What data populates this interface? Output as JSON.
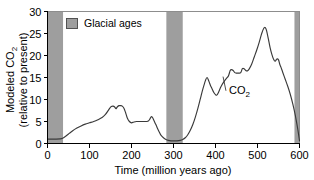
{
  "figure": {
    "background_color": "#ffffff",
    "curve_color": "#3a3a3a",
    "band_color": "#9e9e9e",
    "axis_color": "#000000"
  },
  "axes": {
    "x": {
      "title_main": "Time (million years ago)",
      "ticks": [
        0,
        100,
        200,
        300,
        400,
        500,
        600
      ],
      "tick_labels": [
        "0",
        "100",
        "200",
        "300",
        "400",
        "500",
        "600"
      ],
      "min": 0,
      "max": 600
    },
    "y": {
      "title_line1_main": "Modeled CO",
      "title_line1_sub": "2",
      "title_line2": "(relative to present)",
      "ticks": [
        0,
        5,
        10,
        15,
        20,
        25,
        30
      ],
      "tick_labels": [
        "0",
        "5",
        "10",
        "15",
        "20",
        "25",
        "30"
      ],
      "min": 0,
      "max": 30
    }
  },
  "legend": {
    "label": "Glacial ages",
    "swatch_color": "#9e9e9e"
  },
  "annotations": [
    {
      "name": "co2-curve-label",
      "text_main": "CO",
      "text_sub": "2",
      "x_data": 432,
      "y_data": 11.3,
      "leader_from_x": 418,
      "leader_from_y": 15.2
    }
  ],
  "chart_data": {
    "type": "line",
    "title": "",
    "xlabel": "Time (million years ago)",
    "ylabel": "Modeled CO2 (relative to present)",
    "xlim": [
      0,
      600
    ],
    "ylim": [
      0,
      30
    ],
    "grid": false,
    "legend_position": "top-left-inside",
    "series": [
      {
        "name": "CO2",
        "color": "#3a3a3a",
        "x": [
          0,
          10,
          20,
          30,
          36,
          44,
          52,
          60,
          70,
          80,
          90,
          100,
          110,
          120,
          130,
          138,
          144,
          148,
          152,
          156,
          160,
          163,
          166,
          170,
          174,
          178,
          182,
          186,
          190,
          195,
          200,
          206,
          212,
          220,
          228,
          236,
          240,
          244,
          247,
          250,
          254,
          258,
          262,
          266,
          270,
          276,
          282,
          288,
          294,
          300,
          308,
          316,
          322,
          328,
          334,
          340,
          346,
          352,
          358,
          364,
          370,
          376,
          380,
          384,
          388,
          392,
          396,
          400,
          403,
          407,
          412,
          417,
          422,
          427,
          431,
          435,
          438,
          442,
          446,
          450,
          455,
          460,
          464,
          468,
          472,
          476,
          480,
          486,
          492,
          498,
          504,
          510,
          515,
          519,
          522,
          526,
          530,
          534,
          538,
          542,
          546,
          550,
          553,
          556,
          560,
          566,
          572,
          578,
          584,
          590,
          596,
          600
        ],
        "y": [
          1.0,
          1.0,
          1.0,
          1.05,
          1.2,
          1.7,
          2.3,
          2.9,
          3.5,
          4.0,
          4.4,
          4.7,
          5.0,
          5.4,
          5.9,
          6.6,
          7.4,
          8.0,
          8.4,
          8.5,
          8.3,
          7.9,
          8.3,
          8.6,
          8.6,
          8.5,
          8.0,
          7.0,
          5.8,
          5.0,
          4.7,
          4.9,
          5.0,
          5.0,
          5.0,
          5.0,
          5.1,
          5.6,
          6.1,
          5.9,
          5.1,
          4.3,
          3.4,
          2.6,
          1.9,
          1.3,
          0.9,
          0.7,
          0.6,
          0.6,
          0.6,
          0.7,
          0.9,
          1.3,
          2.0,
          3.0,
          4.3,
          6.0,
          8.0,
          10.2,
          12.4,
          14.3,
          15.0,
          14.2,
          13.2,
          12.4,
          11.6,
          11.1,
          11.0,
          11.6,
          12.7,
          13.6,
          14.3,
          14.9,
          15.4,
          16.6,
          16.8,
          16.6,
          16.1,
          16.0,
          16.0,
          16.1,
          17.0,
          17.0,
          16.6,
          16.5,
          16.9,
          18.0,
          19.6,
          21.2,
          23.0,
          25.0,
          26.2,
          26.3,
          25.5,
          23.7,
          21.8,
          20.3,
          19.2,
          18.7,
          19.2,
          19.0,
          18.0,
          17.3,
          16.2,
          14.6,
          13.0,
          11.2,
          9.0,
          6.4,
          3.2,
          0.6
        ]
      }
    ],
    "shaded_bands": [
      {
        "label": "Glacial ages",
        "x_start": 0,
        "x_end": 37,
        "color": "#9e9e9e"
      },
      {
        "label": "Glacial ages",
        "x_start": 283,
        "x_end": 322,
        "color": "#9e9e9e"
      },
      {
        "label": "Glacial ages",
        "x_start": 588,
        "x_end": 600,
        "color": "#9e9e9e"
      }
    ]
  }
}
